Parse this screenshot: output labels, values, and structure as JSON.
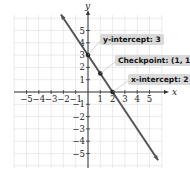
{
  "chart_data": {
    "type": "line",
    "title": "",
    "xlabel": "x",
    "ylabel": "y",
    "xlim": [
      -6,
      6
    ],
    "ylim": [
      -6,
      6
    ],
    "grid": true,
    "x_ticks": [
      -5,
      -4,
      -3,
      -2,
      -1,
      1,
      2,
      3,
      4,
      5
    ],
    "y_ticks": [
      -5,
      -4,
      -3,
      -2,
      -1,
      1,
      2,
      3,
      4,
      5
    ],
    "series": [
      {
        "name": "line",
        "equation": "y = -1.5x + 3",
        "slope": -1.5,
        "intercept": 3,
        "x": [
          -2.2,
          5.7
        ],
        "y": [
          6.3,
          -5.55
        ]
      }
    ],
    "points": [
      {
        "name": "y-intercept",
        "x": 0,
        "y": 3
      },
      {
        "name": "checkpoint",
        "x": 1,
        "y": 1.5
      },
      {
        "name": "x-intercept",
        "x": 2,
        "y": 0
      }
    ],
    "annotations": [
      {
        "text": "y-intercept: 3"
      },
      {
        "text": "Checkpoint: (1, 1.5)"
      },
      {
        "text": "x-intercept: 2"
      }
    ],
    "colors": {
      "line": "#555555",
      "grid": "#dddddd",
      "label_bg": "#d9d9d9"
    }
  }
}
